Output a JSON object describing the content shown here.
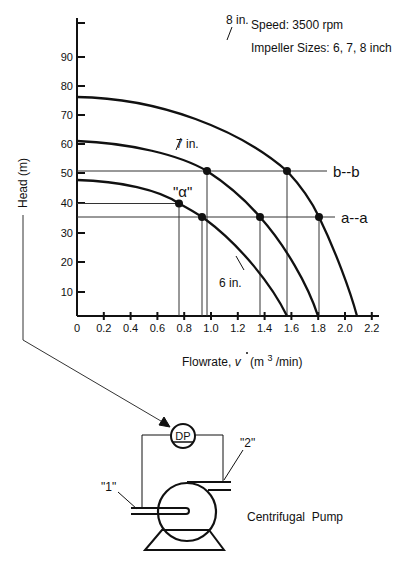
{
  "chart_data": {
    "type": "line",
    "title": "",
    "annotations_top": [
      "Speed: 3500 rpm",
      "Impeller Sizes: 6, 7, 8 inch"
    ],
    "xlabel": "Flowrate, v̇  (m³/min)",
    "xlabel_parts": {
      "main": "Flowrate, ",
      "var": "v",
      "units_open": "(m",
      "sup": "3",
      "units_close": "/min)"
    },
    "ylabel": "Head (m)",
    "xlim": [
      0,
      2.3
    ],
    "ylim": [
      0,
      100
    ],
    "x_ticks": [
      "0",
      "0.2",
      "0.4",
      "0.6",
      "0.8",
      "1.0",
      "1.2",
      "1.4",
      "1.6",
      "1.8",
      "2.0",
      "2.2"
    ],
    "y_ticks": [
      "10",
      "20",
      "30",
      "40",
      "50",
      "60",
      "70",
      "80",
      "90"
    ],
    "grid": false,
    "series": [
      {
        "name": "6 in.",
        "x": [
          0,
          0.3,
          0.6,
          0.76,
          0.93,
          1.1,
          1.3,
          1.45,
          1.57
        ],
        "y": [
          48,
          47,
          43.5,
          40,
          35.5,
          29,
          19,
          10,
          0
        ]
      },
      {
        "name": "7 in.",
        "x": [
          0,
          0.4,
          0.8,
          0.97,
          1.2,
          1.37,
          1.55,
          1.7,
          1.8
        ],
        "y": [
          61,
          59,
          54,
          51,
          44,
          35.5,
          24,
          12,
          0
        ]
      },
      {
        "name": "8 in.",
        "x": [
          0,
          0.5,
          1.0,
          1.3,
          1.57,
          1.81,
          1.95,
          2.04,
          2.09
        ],
        "y": [
          76,
          74,
          67,
          60,
          51,
          35.5,
          23,
          11,
          0
        ]
      }
    ],
    "reference_lines": [
      {
        "name": "b--b",
        "y": 51,
        "x_end": 1.87
      },
      {
        "name": "a--a",
        "y": 35.5,
        "x_end": 1.93
      }
    ],
    "marked_points": [
      {
        "label": "\"α\"",
        "curve": "6 in.",
        "x": 0.76,
        "y": 40
      },
      {
        "curve": "6 in.",
        "line": "a--a",
        "x": 0.93,
        "y": 35.5
      },
      {
        "curve": "7 in.",
        "line": "b--b",
        "x": 0.97,
        "y": 51
      },
      {
        "curve": "7 in.",
        "line": "a--a",
        "x": 1.37,
        "y": 35.5
      },
      {
        "curve": "8 in.",
        "line": "b--b",
        "x": 1.57,
        "y": 51
      },
      {
        "curve": "8 in.",
        "line": "a--a",
        "x": 1.81,
        "y": 35.5
      }
    ]
  },
  "labels": {
    "speed": "Speed: 3500 rpm",
    "impeller": "Impeller Sizes: 6, 7, 8 inch",
    "curve_6": "6 in.",
    "curve_7": "7 in.",
    "curve_8": "8 in.",
    "line_b": "b--b",
    "line_a": "a--a",
    "alpha": "\"α\"",
    "ylabel": "Head (m)",
    "xlabel_main": "Flowrate, ",
    "xlabel_var": "v",
    "xlabel_units_open": "(m",
    "xlabel_sup": "3",
    "xlabel_units_close": "/min)"
  },
  "diagram": {
    "dp_label": "DP",
    "point1": "\"1\"",
    "point2": "\"2\"",
    "pump_label": "Centrifugal  Pump"
  }
}
